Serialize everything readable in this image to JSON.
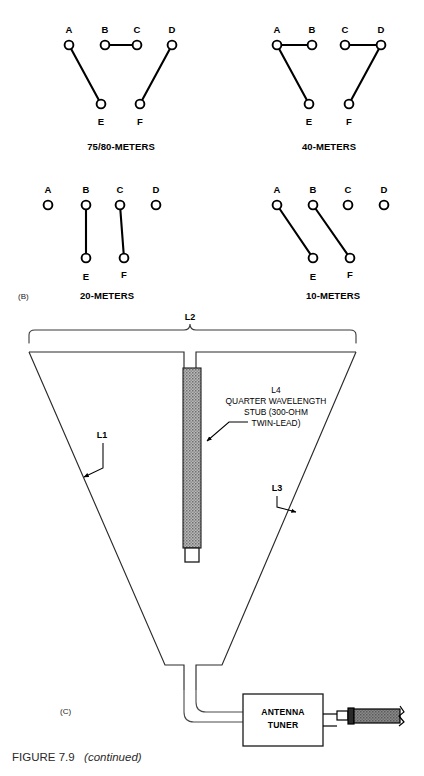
{
  "figure": {
    "caption_main": "FIGURE 7.9",
    "caption_italic": "(continued)"
  },
  "panel_b": {
    "panel_label": "(B)",
    "terminals_top": [
      "A",
      "B",
      "C",
      "D"
    ],
    "terminals_bottom": [
      "E",
      "F"
    ],
    "diagrams": [
      {
        "id": "switch-75-80-meters",
        "title": "75/80-METERS",
        "connections": [
          {
            "from": "A",
            "to": "E"
          },
          {
            "from": "B",
            "to": "C"
          },
          {
            "from": "D",
            "to": "F"
          }
        ]
      },
      {
        "id": "switch-40-meters",
        "title": "40-METERS",
        "connections": [
          {
            "from": "A",
            "to": "B"
          },
          {
            "from": "A",
            "to": "E"
          },
          {
            "from": "C",
            "to": "D"
          },
          {
            "from": "D",
            "to": "F"
          }
        ]
      },
      {
        "id": "switch-20-meters",
        "title": "20-METERS",
        "connections": [
          {
            "from": "B",
            "to": "E"
          },
          {
            "from": "C",
            "to": "F"
          }
        ]
      },
      {
        "id": "switch-10-meters",
        "title": "10-METERS",
        "connections": [
          {
            "from": "A",
            "to": "E"
          },
          {
            "from": "B",
            "to": "F"
          }
        ]
      }
    ]
  },
  "panel_c": {
    "panel_label": "(C)",
    "labels": {
      "l1": "L1",
      "l2": "L2",
      "l3": "L3",
      "l4": "L4"
    },
    "stub_text": [
      "L4",
      "QUARTER WAVELENGTH",
      "STUB (300-OHM",
      "TWIN-LEAD)"
    ],
    "tuner": {
      "line1": "ANTENNA",
      "line2": "TUNER"
    }
  },
  "colors": {
    "ink": "#000000",
    "line": "#2b2b2b",
    "stub_fill": "#9a9a9a",
    "coax_fill": "#7d7d7d",
    "paper": "#ffffff"
  }
}
